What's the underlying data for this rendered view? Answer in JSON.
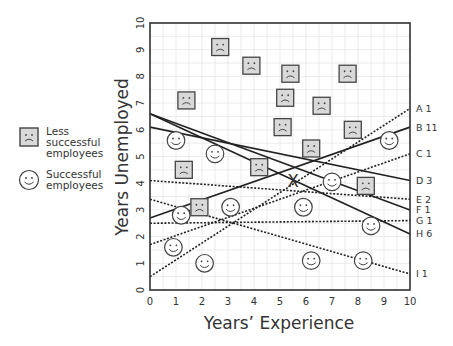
{
  "legend": {
    "items": [
      {
        "icon": "sad-face-square-icon",
        "label_lines": [
          "Less",
          "successful",
          "employees"
        ]
      },
      {
        "icon": "happy-face-circle-icon",
        "label_lines": [
          "Successful",
          "employees"
        ]
      }
    ]
  },
  "chart_data": {
    "type": "scatter",
    "title": "",
    "xlabel": "Years’ Experience",
    "ylabel": "Years Unemployed",
    "xlim": [
      0,
      10
    ],
    "ylim": [
      0,
      10
    ],
    "xticks": [
      "0",
      "1",
      "2",
      "3",
      "4",
      "5",
      "6",
      "7",
      "8",
      "9",
      "10"
    ],
    "yticks": [
      "0",
      "1",
      "2",
      "3",
      "4",
      "5",
      "6",
      "7",
      "8",
      "9",
      "10"
    ],
    "grid": true,
    "series": [
      {
        "name": "Less successful employees",
        "marker": "sad-face-square",
        "points": [
          [
            1.4,
            7.1
          ],
          [
            2.7,
            9.1
          ],
          [
            3.9,
            8.4
          ],
          [
            5.4,
            8.1
          ],
          [
            5.2,
            7.2
          ],
          [
            6.6,
            6.9
          ],
          [
            7.6,
            8.1
          ],
          [
            5.1,
            6.1
          ],
          [
            6.2,
            5.3
          ],
          [
            7.8,
            6.0
          ],
          [
            1.3,
            4.5
          ],
          [
            4.2,
            4.6
          ],
          [
            8.3,
            3.9
          ],
          [
            1.9,
            3.1
          ]
        ]
      },
      {
        "name": "Successful employees",
        "marker": "happy-face-circle",
        "points": [
          [
            1.0,
            5.6
          ],
          [
            2.5,
            5.1
          ],
          [
            9.2,
            5.6
          ],
          [
            1.2,
            2.8
          ],
          [
            3.1,
            3.1
          ],
          [
            5.9,
            3.1
          ],
          [
            7.0,
            4.05
          ],
          [
            0.9,
            1.6
          ],
          [
            2.1,
            1.0
          ],
          [
            6.2,
            1.1
          ],
          [
            8.5,
            2.4
          ],
          [
            8.2,
            1.1
          ]
        ]
      }
    ],
    "marked_point": {
      "label": "X",
      "x": 5.5,
      "y": 4.1
    },
    "lines": [
      {
        "id": "A",
        "count": "1",
        "label": "A 1",
        "style": "dotted",
        "y_at_0": 0.5,
        "y_at_10": 6.8
      },
      {
        "id": "B",
        "count": "11",
        "label": "B 11",
        "style": "solid",
        "y_at_0": 2.7,
        "y_at_10": 6.1
      },
      {
        "id": "C",
        "count": "1",
        "label": "C 1",
        "style": "dotted",
        "y_at_0": 1.7,
        "y_at_10": 5.1
      },
      {
        "id": "D",
        "count": "3",
        "label": "D 3",
        "style": "solid",
        "y_at_0": 6.1,
        "y_at_10": 4.1
      },
      {
        "id": "E",
        "count": "2",
        "label": "E 2",
        "style": "dotted",
        "y_at_0": 4.1,
        "y_at_10": 3.4
      },
      {
        "id": "F",
        "count": "1",
        "label": "F 1",
        "style": "solid",
        "y_at_0": 6.6,
        "y_at_10": 3.0
      },
      {
        "id": "G",
        "count": "1",
        "label": "G 1",
        "style": "dotted",
        "y_at_0": 2.5,
        "y_at_10": 2.6
      },
      {
        "id": "H",
        "count": "6",
        "label": "H 6",
        "style": "solid",
        "y_at_0": 6.6,
        "y_at_10": 2.1
      },
      {
        "id": "I",
        "count": "1",
        "label": "I 1",
        "style": "dotted",
        "y_at_0": 3.4,
        "y_at_10": 0.6
      }
    ]
  }
}
